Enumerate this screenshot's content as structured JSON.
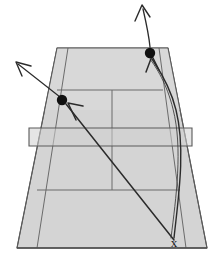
{
  "diagram": {
    "type": "court-trajectory-diagram",
    "view": "perspective-from-baseline",
    "colors": {
      "surface": "#d4d4d4",
      "surface_far": "#cfcfcf",
      "line": "#6b6b6b",
      "line_dark": "#555555",
      "trajectory": "#2b2b2b",
      "dot": "#111111",
      "background": "#ffffff",
      "label": "#1a1a1a"
    },
    "origin": {
      "label": "x",
      "name": "shot-origin-marker",
      "x": 174,
      "y": 243,
      "description": "Player position where both shots originate"
    },
    "court": {
      "name": "tennis-court",
      "baseline_far": {
        "left_x": 57,
        "right_x": 168,
        "y": 48
      },
      "baseline_near": {
        "left_x": 17,
        "right_x": 207,
        "y": 248
      },
      "net_band": {
        "left_x": 29,
        "right_x": 192,
        "top_y": 128,
        "bottom_y": 146
      },
      "service_line_far_y": 90,
      "service_line_near_y": 190,
      "center_service_line": true,
      "singles_sidelines": true
    },
    "shots": [
      {
        "name": "cross-court-shot",
        "label": "",
        "landing_dot": {
          "x": 62,
          "y": 100
        },
        "direction": "up-left",
        "arrow_tip": {
          "x": 16,
          "y": 62
        },
        "trajectory": "straight",
        "description": "Straight cross-court shot landing deep in the left service area, continuing up-left"
      },
      {
        "name": "down-the-line-shot",
        "label": "",
        "landing_dot": {
          "x": 150,
          "y": 53
        },
        "direction": "up",
        "arrow_tip": {
          "x": 142,
          "y": 5
        },
        "trajectory": "curved",
        "description": "Curved down-the-line shot landing near the far baseline, continuing upward"
      }
    ]
  }
}
